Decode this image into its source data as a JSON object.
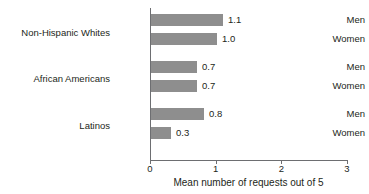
{
  "chart_data": {
    "type": "bar",
    "orientation": "horizontal",
    "title": "",
    "xlabel": "Mean number of requests out of 5",
    "ylabel": "",
    "xlim": [
      0,
      3
    ],
    "xticks": [
      "0",
      "1",
      "2",
      "3"
    ],
    "grid": false,
    "legend": "none",
    "bar_color": "#8e8e8e",
    "axis_color": "#6d6e71",
    "groups": [
      {
        "label": "Non-Hispanic Whites",
        "bars": [
          {
            "category": "Men",
            "value": 1.1,
            "value_label": "1.1"
          },
          {
            "category": "Women",
            "value": 1.0,
            "value_label": "1.0"
          }
        ]
      },
      {
        "label": "African Americans",
        "bars": [
          {
            "category": "Men",
            "value": 0.7,
            "value_label": "0.7"
          },
          {
            "category": "Women",
            "value": 0.7,
            "value_label": "0.7"
          }
        ]
      },
      {
        "label": "Latinos",
        "bars": [
          {
            "category": "Men",
            "value": 0.8,
            "value_label": "0.8"
          },
          {
            "category": "Women",
            "value": 0.3,
            "value_label": "0.3"
          }
        ]
      }
    ]
  }
}
